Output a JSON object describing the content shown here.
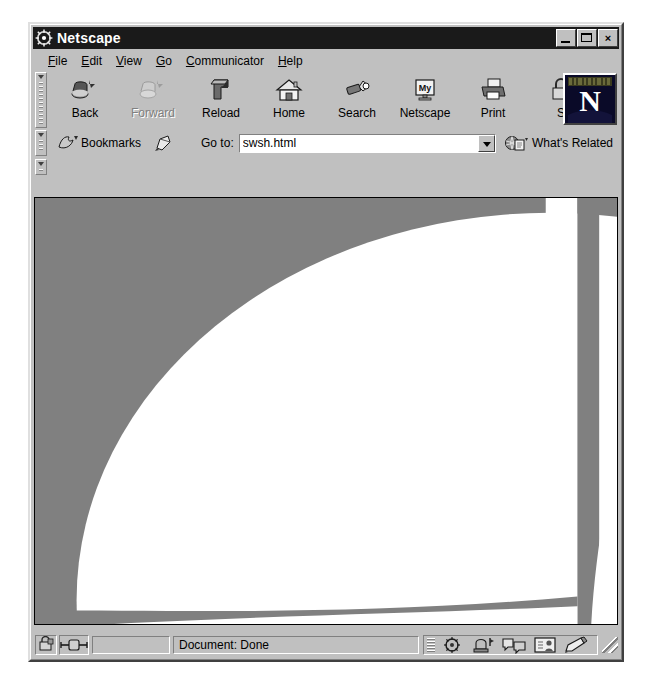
{
  "window": {
    "title": "Netscape",
    "title_icon": "netscape-ship-wheel-icon",
    "buttons": {
      "minimize": "minimize-icon",
      "maximize": "maximize-icon",
      "close": "×"
    }
  },
  "menubar": {
    "items": [
      {
        "name": "file",
        "accel": "F",
        "rest": "ile"
      },
      {
        "name": "edit",
        "accel": "E",
        "rest": "dit"
      },
      {
        "name": "view",
        "accel": "V",
        "rest": "iew"
      },
      {
        "name": "go",
        "accel": "G",
        "rest": "o"
      },
      {
        "name": "communicator",
        "accel": "C",
        "rest": "ommunicator"
      },
      {
        "name": "help",
        "accel": "H",
        "rest": "elp"
      }
    ]
  },
  "toolbar": {
    "buttons": [
      {
        "label": "Back",
        "icon": "back-arrow-icon",
        "disabled": false
      },
      {
        "label": "Forward",
        "icon": "forward-arrow-icon",
        "disabled": true
      },
      {
        "label": "Reload",
        "icon": "reload-icon",
        "disabled": false
      },
      {
        "label": "Home",
        "icon": "home-icon",
        "disabled": false
      },
      {
        "label": "Search",
        "icon": "search-flashlight-icon",
        "disabled": false
      },
      {
        "label": "Netscape",
        "icon": "my-netscape-icon",
        "disabled": false
      },
      {
        "label": "Print",
        "icon": "printer-icon",
        "disabled": false
      },
      {
        "label": "S",
        "icon": "security-lock-icon",
        "disabled": false
      }
    ],
    "brand_letter": "N",
    "brand_name": "netscape-n-logo"
  },
  "location": {
    "bookmarks_label": "Bookmarks",
    "bookmarks_icon": "bookmark-flag-icon",
    "page_proxy_icon": "page-proxy-icon",
    "goto_label": "Go to:",
    "url_value": "swsh.html",
    "url_placeholder": "",
    "dropdown_icon": "chevron-down-icon",
    "whats_related_label": "What's Related",
    "whats_related_icon": "globe-page-icon"
  },
  "statusbar": {
    "security_icon": "security-padlock-icon",
    "connection_icon": "network-connection-icon",
    "progress_value": "",
    "status_text": "Document: Done",
    "component_icons": [
      "navigator-icon",
      "mailbox-icon",
      "discussions-icon",
      "address-book-icon",
      "composer-icon"
    ],
    "resize_grip_icon": "resize-grip-icon"
  },
  "content": {
    "page_name": "swsh.html",
    "background_color": "#808080",
    "shape_color": "#ffffff",
    "description": "large white quarter/ellipse arc on grey page background",
    "shapes": [
      {
        "name": "primary-white-ellipse",
        "color": "#ffffff"
      },
      {
        "name": "secondary-white-arc",
        "color": "#ffffff"
      },
      {
        "name": "bottom-white-band",
        "color": "#ffffff"
      }
    ]
  }
}
